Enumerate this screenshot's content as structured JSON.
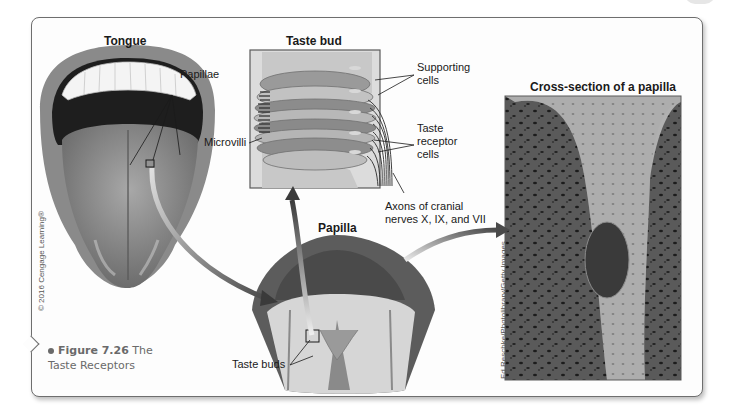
{
  "figure": {
    "number": "Figure 7.26",
    "title": "The Taste Receptors",
    "copyright": "© 2016 Cengage Learning®",
    "photo_credit": "Ed Reschke/Photolibrary/Getty Images"
  },
  "panels": {
    "tongue": {
      "title": "Tongue",
      "labels": {
        "papillae": "Papillae"
      }
    },
    "taste_bud": {
      "title": "Taste bud",
      "labels": {
        "supporting_cells_1": "Supporting",
        "supporting_cells_2": "cells",
        "microvilli": "Microvilli",
        "taste_receptor_1": "Taste",
        "taste_receptor_2": "receptor",
        "taste_receptor_3": "cells",
        "axons_1": "Axons of cranial",
        "axons_2": "nerves X, IX, and VII"
      }
    },
    "papilla": {
      "title": "Papilla",
      "labels": {
        "taste_buds": "Taste buds"
      }
    },
    "cross_section": {
      "title": "Cross-section of a papilla"
    }
  },
  "colors": {
    "frame_border": "#6e6e6e",
    "arrow": "#5a5a5a",
    "text": "#1a1a1a",
    "caption_text": "#6a6a6a"
  }
}
